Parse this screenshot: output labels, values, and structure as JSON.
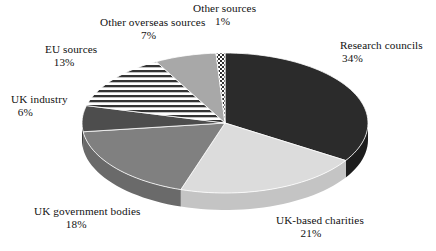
{
  "chart_data": {
    "type": "pie",
    "title": "",
    "subtitle": "",
    "xlabel": "",
    "ylabel": "",
    "legend_position": "none",
    "grid": false,
    "three_d": true,
    "start_angle_deg": 0,
    "direction": "clockwise",
    "categories": [
      "Research councils",
      "UK-based charities",
      "UK government bodies",
      "UK industry",
      "EU sources",
      "Other overseas sources",
      "Other sources"
    ],
    "values": [
      34,
      21,
      18,
      6,
      13,
      7,
      1
    ],
    "value_unit": "%",
    "slices": [
      {
        "label": "Research councils",
        "value": 34,
        "value_text": "34%",
        "fill": "#2b2b2b",
        "pattern": "solid",
        "side_fill": "#1d1d1d"
      },
      {
        "label": "UK-based charities",
        "value": 21,
        "value_text": "21%",
        "fill": "#dcdcdc",
        "pattern": "solid",
        "side_fill": "#c4c4c4"
      },
      {
        "label": "UK government bodies",
        "value": 18,
        "value_text": "18%",
        "fill": "#808080",
        "pattern": "solid",
        "side_fill": "#6a6a6a"
      },
      {
        "label": "UK industry",
        "value": 6,
        "value_text": "6%",
        "fill": "#4d4d4d",
        "pattern": "solid",
        "side_fill": "#3c3c3c"
      },
      {
        "label": "EU sources",
        "value": 13,
        "value_text": "13%",
        "fill": "#ffffff",
        "pattern": "horizontal-stripes",
        "side_fill": "#c9c9c9"
      },
      {
        "label": "Other overseas sources",
        "value": 7,
        "value_text": "7%",
        "fill": "#a8a8a8",
        "pattern": "solid",
        "side_fill": "#8f8f8f"
      },
      {
        "label": "Other sources",
        "value": 1,
        "value_text": "1%",
        "fill": "#ffffff",
        "pattern": "checkerboard",
        "side_fill": "#b0b0b0"
      }
    ]
  },
  "labels": {
    "research_councils": {
      "name": "Research councils",
      "pct": "34%"
    },
    "uk_based_charities": {
      "name": "UK-based charities",
      "pct": "21%"
    },
    "uk_government_bodies": {
      "name": "UK government bodies",
      "pct": "18%"
    },
    "uk_industry": {
      "name": "UK industry",
      "pct": "6%"
    },
    "eu_sources": {
      "name": "EU sources",
      "pct": "13%"
    },
    "other_overseas_sources": {
      "name": "Other overseas sources",
      "pct": "7%"
    },
    "other_sources": {
      "name": "Other sources",
      "pct": "1%"
    }
  }
}
